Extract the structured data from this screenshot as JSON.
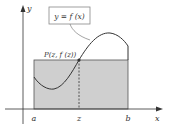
{
  "figure": {
    "function_label": "y = f (x)",
    "point_label": "P(z, f (z))",
    "axes": {
      "x_label": "x",
      "y_label": "y"
    },
    "ticks": {
      "a": "a",
      "z": "z",
      "b": "b"
    },
    "colors": {
      "rectangle_fill": "#cfcfcf",
      "rectangle_stroke": "#555555",
      "curve": "#333333",
      "axes": "#333333",
      "label_box_stroke": "#888888"
    }
  }
}
